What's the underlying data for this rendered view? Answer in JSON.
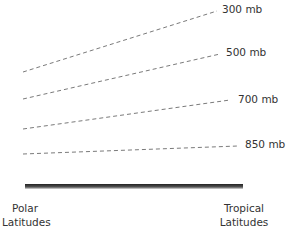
{
  "diagram": {
    "isobars": [
      {
        "label": "300 mb",
        "x1": 23,
        "y1": 72,
        "x2": 217,
        "y2": 11,
        "lx": 222,
        "ly": 3
      },
      {
        "label": "500 mb",
        "x1": 23,
        "y1": 99,
        "x2": 220,
        "y2": 54,
        "lx": 226,
        "ly": 46
      },
      {
        "label": "700 mb",
        "x1": 23,
        "y1": 129,
        "x2": 230,
        "y2": 100,
        "lx": 238,
        "ly": 93
      },
      {
        "label": "850 mb",
        "x1": 23,
        "y1": 154,
        "x2": 238,
        "y2": 146,
        "lx": 245,
        "ly": 138
      }
    ],
    "surface": {
      "x1": 25,
      "x2": 243,
      "y": 186
    },
    "left_label": {
      "line1": "Polar",
      "line2": "Latitudes"
    },
    "right_label": {
      "line1": "Tropical",
      "line2": "Latitudes"
    },
    "colors": {
      "dash": "#7a7a7a",
      "surface": "#333333",
      "text": "#333333"
    }
  }
}
